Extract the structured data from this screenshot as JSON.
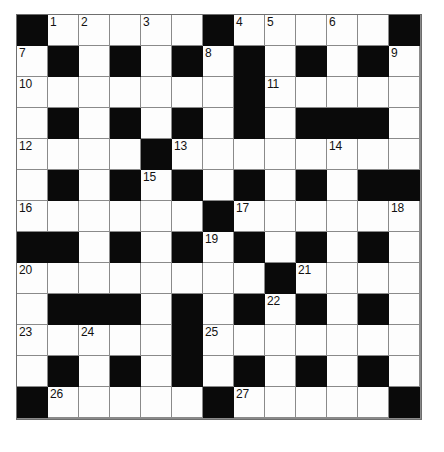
{
  "puzzle": {
    "type": "crossword-grid",
    "title": "",
    "rows": 13,
    "columns": 13,
    "cell_size_px": 31,
    "colors": {
      "block": "#0a0a0a",
      "cell": "#fdfdfd",
      "grid_line": "#8a8a8a",
      "number": "#111111",
      "background": "#ffffff"
    },
    "numbers_visible": [
      "1",
      "2",
      "3",
      "4",
      "5",
      "6",
      "7",
      "8",
      "9",
      "10",
      "11",
      "12",
      "13",
      "14",
      "15",
      "16",
      "17",
      "18",
      "19",
      "20",
      "21",
      "22",
      "23",
      "24",
      "25",
      "26",
      "27"
    ],
    "grid": [
      [
        {
          "b": true
        },
        {
          "b": false,
          "n": "1"
        },
        {
          "b": false,
          "n": "2"
        },
        {
          "b": false
        },
        {
          "b": false,
          "n": "3"
        },
        {
          "b": false
        },
        {
          "b": true
        },
        {
          "b": false,
          "n": "4"
        },
        {
          "b": false,
          "n": "5"
        },
        {
          "b": false
        },
        {
          "b": false,
          "n": "6"
        },
        {
          "b": false
        },
        {
          "b": true
        }
      ],
      [
        {
          "b": false,
          "n": "7"
        },
        {
          "b": true
        },
        {
          "b": false
        },
        {
          "b": true
        },
        {
          "b": false
        },
        {
          "b": true
        },
        {
          "b": false,
          "n": "8"
        },
        {
          "b": true
        },
        {
          "b": false
        },
        {
          "b": true
        },
        {
          "b": false
        },
        {
          "b": true
        },
        {
          "b": false,
          "n": "9"
        }
      ],
      [
        {
          "b": false,
          "n": "10"
        },
        {
          "b": false
        },
        {
          "b": false
        },
        {
          "b": false
        },
        {
          "b": false
        },
        {
          "b": false
        },
        {
          "b": false
        },
        {
          "b": true
        },
        {
          "b": false,
          "n": "11"
        },
        {
          "b": false
        },
        {
          "b": false
        },
        {
          "b": false
        },
        {
          "b": false
        }
      ],
      [
        {
          "b": false
        },
        {
          "b": true
        },
        {
          "b": false
        },
        {
          "b": true
        },
        {
          "b": false
        },
        {
          "b": true
        },
        {
          "b": false
        },
        {
          "b": true
        },
        {
          "b": false
        },
        {
          "b": true
        },
        {
          "b": true
        },
        {
          "b": true
        },
        {
          "b": false
        }
      ],
      [
        {
          "b": false,
          "n": "12"
        },
        {
          "b": false
        },
        {
          "b": false
        },
        {
          "b": false
        },
        {
          "b": true
        },
        {
          "b": false,
          "n": "13"
        },
        {
          "b": false
        },
        {
          "b": false
        },
        {
          "b": false
        },
        {
          "b": false
        },
        {
          "b": false,
          "n": "14"
        },
        {
          "b": false
        },
        {
          "b": false
        }
      ],
      [
        {
          "b": false
        },
        {
          "b": true
        },
        {
          "b": false
        },
        {
          "b": true
        },
        {
          "b": false,
          "n": "15"
        },
        {
          "b": true
        },
        {
          "b": false
        },
        {
          "b": true
        },
        {
          "b": false
        },
        {
          "b": true
        },
        {
          "b": false
        },
        {
          "b": true
        },
        {
          "b": true
        }
      ],
      [
        {
          "b": false,
          "n": "16"
        },
        {
          "b": false
        },
        {
          "b": false
        },
        {
          "b": false
        },
        {
          "b": false
        },
        {
          "b": false
        },
        {
          "b": true
        },
        {
          "b": false,
          "n": "17"
        },
        {
          "b": false
        },
        {
          "b": false
        },
        {
          "b": false
        },
        {
          "b": false
        },
        {
          "b": false,
          "n": "18"
        }
      ],
      [
        {
          "b": true
        },
        {
          "b": true
        },
        {
          "b": false
        },
        {
          "b": true
        },
        {
          "b": false
        },
        {
          "b": true
        },
        {
          "b": false,
          "n": "19"
        },
        {
          "b": true
        },
        {
          "b": false
        },
        {
          "b": true
        },
        {
          "b": false
        },
        {
          "b": true
        },
        {
          "b": false
        }
      ],
      [
        {
          "b": false,
          "n": "20"
        },
        {
          "b": false
        },
        {
          "b": false
        },
        {
          "b": false
        },
        {
          "b": false
        },
        {
          "b": false
        },
        {
          "b": false
        },
        {
          "b": false
        },
        {
          "b": true
        },
        {
          "b": false,
          "n": "21"
        },
        {
          "b": false
        },
        {
          "b": false
        },
        {
          "b": false
        }
      ],
      [
        {
          "b": false
        },
        {
          "b": true
        },
        {
          "b": true
        },
        {
          "b": true
        },
        {
          "b": false
        },
        {
          "b": true
        },
        {
          "b": false
        },
        {
          "b": true
        },
        {
          "b": false,
          "n": "22"
        },
        {
          "b": true
        },
        {
          "b": false
        },
        {
          "b": true
        },
        {
          "b": false
        }
      ],
      [
        {
          "b": false,
          "n": "23"
        },
        {
          "b": false
        },
        {
          "b": false,
          "n": "24"
        },
        {
          "b": false
        },
        {
          "b": false
        },
        {
          "b": true
        },
        {
          "b": false,
          "n": "25"
        },
        {
          "b": false
        },
        {
          "b": false
        },
        {
          "b": false
        },
        {
          "b": false
        },
        {
          "b": false
        },
        {
          "b": false
        }
      ],
      [
        {
          "b": false
        },
        {
          "b": true
        },
        {
          "b": false
        },
        {
          "b": true
        },
        {
          "b": false
        },
        {
          "b": true
        },
        {
          "b": false
        },
        {
          "b": true
        },
        {
          "b": false
        },
        {
          "b": true
        },
        {
          "b": false
        },
        {
          "b": true
        },
        {
          "b": false
        }
      ],
      [
        {
          "b": true
        },
        {
          "b": false,
          "n": "26"
        },
        {
          "b": false
        },
        {
          "b": false
        },
        {
          "b": false
        },
        {
          "b": false
        },
        {
          "b": true
        },
        {
          "b": false,
          "n": "27"
        },
        {
          "b": false
        },
        {
          "b": false
        },
        {
          "b": false
        },
        {
          "b": false
        },
        {
          "b": true
        }
      ]
    ]
  }
}
